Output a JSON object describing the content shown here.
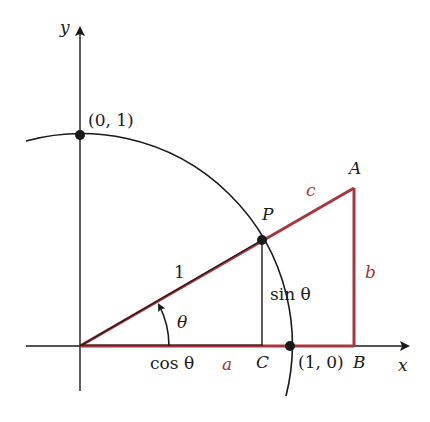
{
  "diagram": {
    "colors": {
      "ink": "#1a1a1a",
      "triangle": "#a8343c",
      "background": "#ffffff"
    },
    "axes": {
      "x_label": "x",
      "y_label": "y"
    },
    "points": {
      "top": "(0, 1)",
      "right": "(1, 0)",
      "P": "P",
      "A": "A",
      "B": "B",
      "C": "C"
    },
    "labels": {
      "hypotenuse_unit": "1",
      "angle": "θ",
      "cos": "cos θ",
      "sin": "sin θ",
      "side_a": "a",
      "side_b": "b",
      "side_c": "c"
    }
  }
}
